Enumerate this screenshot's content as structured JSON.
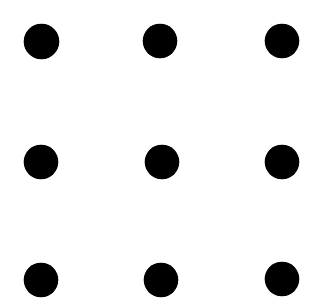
{
  "canvas": {
    "width": 317,
    "height": 308,
    "background_color": "#FFFFFF"
  },
  "figure": {
    "dot_color": "#000000",
    "dot_count": 9,
    "rows": 3,
    "columns": 3
  },
  "chart_data": {
    "type": "scatter",
    "title": "",
    "xlabel": "",
    "ylabel": "",
    "xlim": [
      0,
      317
    ],
    "ylim": [
      0,
      308
    ],
    "grid": false,
    "legend": null,
    "marker": "circle",
    "marker_color": "#000000",
    "marker_diameter": 34,
    "column_centers_x": [
      41,
      161,
      282
    ],
    "row_centers_y": [
      41,
      162,
      280
    ],
    "points": [
      {
        "name": "top-left",
        "row": 0,
        "col": 0,
        "cx": 41,
        "cy": 41,
        "d": 35
      },
      {
        "name": "top-center",
        "row": 0,
        "col": 1,
        "cx": 160,
        "cy": 41,
        "d": 34
      },
      {
        "name": "top-right",
        "row": 0,
        "col": 2,
        "cx": 282,
        "cy": 41,
        "d": 34
      },
      {
        "name": "middle-left",
        "row": 1,
        "col": 0,
        "cx": 41,
        "cy": 162,
        "d": 34
      },
      {
        "name": "middle-center",
        "row": 1,
        "col": 1,
        "cx": 162,
        "cy": 162,
        "d": 34
      },
      {
        "name": "middle-right",
        "row": 1,
        "col": 2,
        "cx": 282,
        "cy": 162,
        "d": 34
      },
      {
        "name": "bottom-left",
        "row": 2,
        "col": 0,
        "cx": 41,
        "cy": 280,
        "d": 34
      },
      {
        "name": "bottom-center",
        "row": 2,
        "col": 1,
        "cx": 161,
        "cy": 280,
        "d": 34
      },
      {
        "name": "bottom-right",
        "row": 2,
        "col": 2,
        "cx": 282,
        "cy": 279,
        "d": 34
      }
    ]
  }
}
